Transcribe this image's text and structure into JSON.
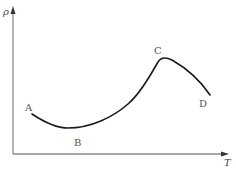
{
  "diagram": {
    "axes": {
      "y_label": "ρ",
      "x_label": "T",
      "color": "#8a8a8a"
    },
    "curve": {
      "color": "#1a1a1a",
      "points": [
        {
          "label": "A",
          "x": 32,
          "y": 114
        },
        {
          "label": "B",
          "x": 68,
          "y": 128
        },
        {
          "label": "C",
          "x": 162,
          "y": 58
        },
        {
          "label": "D",
          "x": 210,
          "y": 95
        }
      ]
    },
    "labels": {
      "A": "A",
      "B": "B",
      "C": "C",
      "D": "D"
    }
  }
}
